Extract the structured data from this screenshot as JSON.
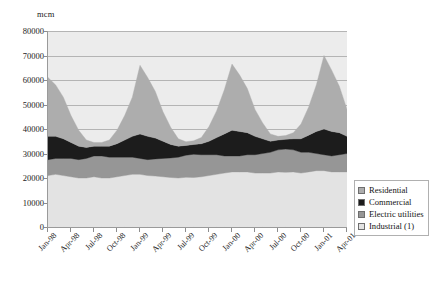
{
  "chart_data": {
    "type": "area",
    "stacked": true,
    "title": "",
    "xlabel": "",
    "ylabel": "mcm",
    "ylim": [
      0,
      80000
    ],
    "ytick_step": 10000,
    "yticks": [
      0,
      10000,
      20000,
      30000,
      40000,
      50000,
      60000,
      70000,
      80000
    ],
    "grid": true,
    "legend_position": "lower-right",
    "x_tick_labels": [
      "Jan-98",
      "Apr-98",
      "Jul-98",
      "Oct-98",
      "Jan-99",
      "Apr-99",
      "Jul-99",
      "Oct-99",
      "Jan-00",
      "Apr-00",
      "Jul-00",
      "Oct-00",
      "Jan-01",
      "Apr-01"
    ],
    "x_tick_indices": [
      0,
      3,
      6,
      9,
      12,
      15,
      18,
      21,
      24,
      27,
      30,
      33,
      36,
      39
    ],
    "x": [
      "Jan-98",
      "Feb-98",
      "Mar-98",
      "Apr-98",
      "May-98",
      "Jun-98",
      "Jul-98",
      "Aug-98",
      "Sep-98",
      "Oct-98",
      "Nov-98",
      "Dec-98",
      "Jan-99",
      "Feb-99",
      "Mar-99",
      "Apr-99",
      "May-99",
      "Jun-99",
      "Jul-99",
      "Aug-99",
      "Sep-99",
      "Oct-99",
      "Nov-99",
      "Dec-99",
      "Jan-00",
      "Feb-00",
      "Mar-00",
      "Apr-00",
      "May-00",
      "Jun-00",
      "Jul-00",
      "Aug-00",
      "Sep-00",
      "Oct-00",
      "Nov-00",
      "Dec-00",
      "Jan-01",
      "Feb-01",
      "Mar-01",
      "Apr-01"
    ],
    "series": [
      {
        "name": "Industrial (1)",
        "color": "#e3e3e3",
        "values": [
          21000,
          21500,
          21000,
          20500,
          20000,
          20000,
          20500,
          20000,
          20000,
          20500,
          21000,
          21500,
          21500,
          21000,
          20800,
          20500,
          20200,
          20000,
          20300,
          20200,
          20500,
          21000,
          21500,
          22000,
          22500,
          22500,
          22500,
          22000,
          22000,
          22000,
          22500,
          22300,
          22500,
          22000,
          22500,
          23000,
          23000,
          22500,
          22500,
          22500
        ]
      },
      {
        "name": "Electric utilities",
        "color": "#969696",
        "values": [
          6500,
          6500,
          7000,
          7500,
          7500,
          8000,
          8500,
          9000,
          8500,
          8000,
          7500,
          7000,
          6500,
          6500,
          7000,
          7500,
          8000,
          8500,
          9000,
          9500,
          9000,
          8500,
          8000,
          7000,
          6500,
          6500,
          7000,
          7500,
          8000,
          8500,
          9000,
          9500,
          9000,
          8500,
          8000,
          7000,
          6500,
          6500,
          7000,
          7500
        ]
      },
      {
        "name": "Commercial",
        "color": "#1c1c1c",
        "values": [
          9500,
          9000,
          8000,
          6500,
          5500,
          4500,
          4000,
          4000,
          4500,
          5500,
          7000,
          8500,
          10000,
          9500,
          8500,
          7000,
          5500,
          4500,
          4000,
          4000,
          4500,
          5500,
          7000,
          9000,
          10500,
          10000,
          9000,
          7500,
          6000,
          4500,
          4000,
          4000,
          4500,
          5500,
          7000,
          9000,
          10500,
          10000,
          9000,
          7000
        ]
      },
      {
        "name": "Residential",
        "color": "#adadad",
        "values": [
          24000,
          21000,
          17000,
          11000,
          6500,
          3000,
          1500,
          1500,
          2500,
          5500,
          10000,
          16000,
          28000,
          24000,
          19000,
          12000,
          7000,
          3000,
          1500,
          1500,
          2500,
          6000,
          11000,
          18000,
          27000,
          23000,
          18000,
          11000,
          6500,
          3000,
          1500,
          1500,
          2500,
          6000,
          11500,
          19000,
          30000,
          25000,
          19000,
          11000
        ]
      }
    ]
  },
  "legend": {
    "items": [
      {
        "label": "Residential",
        "color": "#adadad"
      },
      {
        "label": "Commercial",
        "color": "#1c1c1c"
      },
      {
        "label": "Electric utilities",
        "color": "#969696"
      },
      {
        "label": "Industrial (1)",
        "color": "#e3e3e3"
      }
    ]
  }
}
